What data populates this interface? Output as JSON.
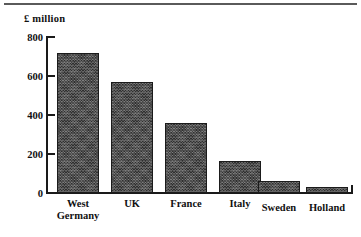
{
  "chart_data": {
    "type": "bar",
    "title": "",
    "subtitle": "",
    "ylabel": "£ million",
    "xlabel": "",
    "categories": [
      "West Germany",
      "UK",
      "France",
      "Italy",
      "Sweden",
      "Holland"
    ],
    "values": [
      720,
      570,
      360,
      165,
      62,
      30
    ],
    "ylim": [
      0,
      800
    ],
    "yticks": [
      0,
      200,
      400,
      600,
      800
    ],
    "ytick_labels": [
      "0",
      "200",
      "400",
      "600",
      "800"
    ],
    "grid": false,
    "legend": null,
    "series": [
      {
        "name": "£ million",
        "values": [
          720,
          570,
          360,
          165,
          62,
          30
        ]
      }
    ],
    "bar_color": "#4b4b4b",
    "axis_color": "#1a1a1a",
    "text_color": "#111111"
  },
  "axis": {
    "y_title": "£ million",
    "ticks": [
      {
        "label": "800",
        "value": 800
      },
      {
        "label": "600",
        "value": 600
      },
      {
        "label": "400",
        "value": 400
      },
      {
        "label": "200",
        "value": 200
      },
      {
        "label": "0",
        "value": 0
      }
    ]
  },
  "categories": [
    {
      "label": "West\nGermany",
      "value": 720
    },
    {
      "label": "UK",
      "value": 570
    },
    {
      "label": "France",
      "value": 360
    },
    {
      "label": "Italy",
      "value": 165
    },
    {
      "label": "Sweden",
      "value": 62
    },
    {
      "label": "Holland",
      "value": 30
    }
  ]
}
